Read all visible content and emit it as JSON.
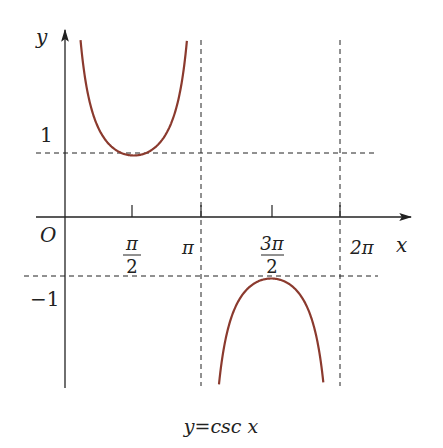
{
  "chart_data": {
    "type": "line",
    "caption": "y=csc x",
    "xlabel": "x",
    "ylabel": "y",
    "origin_label": "O",
    "x_ticks": [
      {
        "value": 1.5708,
        "label": "π/2",
        "num": "π",
        "den": "2"
      },
      {
        "value": 3.1416,
        "label": "π"
      },
      {
        "value": 4.7124,
        "label": "3π/2",
        "num": "3π",
        "den": "2"
      },
      {
        "value": 6.2832,
        "label": "2π"
      }
    ],
    "y_ticks": [
      {
        "value": 1,
        "label": "1"
      },
      {
        "value": -1,
        "label": "−1"
      }
    ],
    "asymptotes_x": [
      3.1416,
      6.2832
    ],
    "reference_lines_y": [
      1,
      -1
    ],
    "series": [
      {
        "name": "csc x on (0, π)",
        "x_range": [
          0.07,
          3.07
        ],
        "min_point": [
          1.5708,
          1
        ],
        "color": "#8B3A2E"
      },
      {
        "name": "csc x on (π, 2π)",
        "x_range": [
          3.22,
          6.2
        ],
        "max_point": [
          4.7124,
          -1
        ],
        "color": "#8B3A2E"
      }
    ],
    "xlim": [
      -0.4,
      7.5
    ],
    "ylim": [
      -2.8,
      2.9
    ],
    "grid": false,
    "curve_color": "#8B3A2E",
    "axis_color": "#222222"
  }
}
